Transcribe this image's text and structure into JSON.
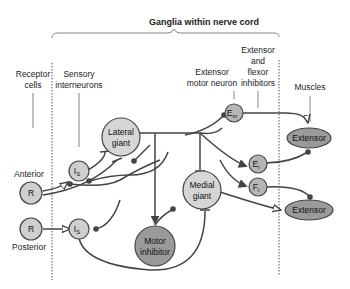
{
  "title": "Ganglia within nerve cord",
  "column_labels": {
    "receptor_cells": [
      "Receptor",
      "cells"
    ],
    "sensory_interneurons": [
      "Sensory",
      "interneurons"
    ],
    "extensor_motor_neuron": [
      "Extensor",
      "motor neuron"
    ],
    "inhibitors": [
      "Extensor",
      "and",
      "flexor",
      "inhibitors"
    ],
    "muscles": "Muscles"
  },
  "side_labels": {
    "anterior": "Anterior",
    "posterior": "Posterior"
  },
  "nodes": {
    "receptor_anterior": "R",
    "receptor_posterior": "R",
    "interneuron_top": "I",
    "interneuron_top_sub": "S",
    "interneuron_bottom": "I",
    "interneuron_bottom_sub": "S",
    "lateral_giant": [
      "Lateral",
      "giant"
    ],
    "medial_giant": [
      "Medial",
      "giant"
    ],
    "motor_inhibitor": [
      "Motor",
      "inhibitor"
    ],
    "extensor_motor": "E",
    "extensor_motor_sub": "m",
    "extensor_inhibitor": "E",
    "extensor_inhibitor_sub": "i",
    "flexor_inhibitor": "F",
    "flexor_inhibitor_sub": "i",
    "muscle_top": "Extensor",
    "muscle_bottom": "Extensor"
  },
  "colors": {
    "light_node": "#cfcfcf",
    "dark_node": "#9a9a9a",
    "wire": "#444444"
  }
}
